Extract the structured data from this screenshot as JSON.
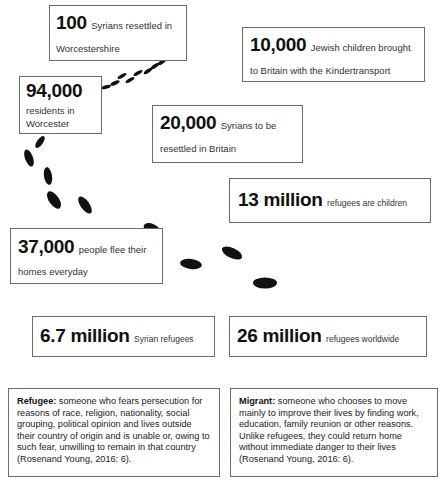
{
  "stats": [
    {
      "id": "worcestershire",
      "number": "100",
      "text_inline": "Syrians resettled in",
      "text_line2": "Worcestershire"
    },
    {
      "id": "kindertransport",
      "number": "10,000",
      "text_inline": "Jewish children brought",
      "text_line2": "to Britain with the Kindertransport"
    },
    {
      "id": "worcester-residents",
      "number": "94,000",
      "text_line1": "residents in",
      "text_line2": "Worcester"
    },
    {
      "id": "britain-resettle",
      "number": "20,000",
      "text_inline": "Syrians to be",
      "text_line2": "resettled in Britain"
    },
    {
      "id": "children",
      "number": "13 million",
      "text_inline": "refugees are children"
    },
    {
      "id": "flee-daily",
      "number": "37,000",
      "text_inline": "people flee their",
      "text_line2": "homes everyday"
    },
    {
      "id": "syrian-refugees",
      "number": "6.7 million",
      "text_inline": "Syrian refugees"
    },
    {
      "id": "worldwide",
      "number": "26 million",
      "text_inline": "refugees worldwide"
    }
  ],
  "definitions": {
    "refugee": {
      "term": "Refugee:",
      "text": " someone who fears persecution for reasons of race, religion, nationality, social grouping, political opinion and lives outside their country of origin and is unable or, owing to such fear, unwilling to remain in that country (Rosenand Young, 2016: 6)."
    },
    "migrant": {
      "term": "Migrant:",
      "text": " someone who chooses to move mainly to improve their lives by finding work, education, family reunion or other reasons. Unlike refugees, they could return home without immediate danger to their lives (Rosenand Young, 2016: 6)."
    }
  },
  "decor": {
    "footprints_color": "#111111",
    "border_color": "#6b6b6b"
  }
}
